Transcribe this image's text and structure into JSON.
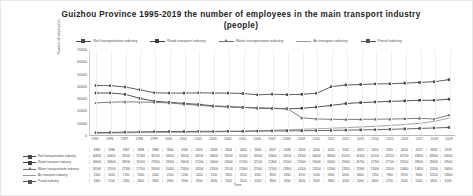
{
  "chart_data": {
    "type": "line",
    "title": "Guizhou Province 1995-2019 the number of employees in the main transport industry (people)",
    "xlabel": "Time",
    "ylabel": "Number of employees",
    "ylim": [
      0,
      70000
    ],
    "yticks": [
      0,
      10000,
      20000,
      30000,
      40000,
      50000,
      60000,
      70000
    ],
    "grid": true,
    "legend_position": "top",
    "x": [
      1995,
      1996,
      1997,
      1998,
      1999,
      2000,
      2001,
      2002,
      2003,
      2004,
      2005,
      2006,
      2007,
      2008,
      2009,
      2010,
      2011,
      2012,
      2013,
      2014,
      2015,
      2016,
      2017,
      2018,
      2019
    ],
    "categories": [
      "1995",
      "1996",
      "1997",
      "1998",
      "1999",
      "2000",
      "2001",
      "2002",
      "2003",
      "2004",
      "2005",
      "2006",
      "2007",
      "2008",
      "2009",
      "2010",
      "2011",
      "2012",
      "2013",
      "2014",
      "2015",
      "2016",
      "2017",
      "2018",
      "2019"
    ],
    "series": [
      {
        "name": "Rail transportation industry",
        "color": "#4a4a4a",
        "marker": "square",
        "values": [
          40800,
          40600,
          39500,
          37200,
          34700,
          34500,
          34500,
          34700,
          34600,
          34500,
          34200,
          33100,
          33600,
          33200,
          33500,
          34400,
          39800,
          41200,
          41600,
          42100,
          42200,
          42700,
          43300,
          43900,
          45600
        ]
      },
      {
        "name": "Road transport industry",
        "color": "#3f3f3f",
        "marker": "square",
        "values": [
          34600,
          34600,
          33500,
          30100,
          27800,
          26900,
          26000,
          25200,
          24000,
          23400,
          22700,
          22100,
          21800,
          21500,
          22000,
          23000,
          24400,
          25900,
          26700,
          27200,
          27700,
          28100,
          28600,
          28600,
          29500
        ]
      },
      {
        "name": "Water transportation industry",
        "color": "#6e6e6e",
        "marker": "triangle",
        "values": [
          26500,
          27000,
          27300,
          27100,
          26900,
          26400,
          25300,
          24500,
          23500,
          23100,
          22800,
          22300,
          22100,
          21800,
          14100,
          13200,
          12900,
          12800,
          12900,
          13000,
          13100,
          13400,
          13800,
          13100,
          16400
        ]
      },
      {
        "name": "Air transport industry",
        "color": "#9a9a9a",
        "marker": "none",
        "values": [
          1500,
          1600,
          1700,
          1900,
          2000,
          2100,
          2200,
          2400,
          2500,
          2800,
          3100,
          3500,
          3900,
          4300,
          4700,
          5100,
          5600,
          6000,
          6600,
          7200,
          7900,
          8700,
          9600,
          11200,
          13900
        ]
      },
      {
        "name": "Postal industry",
        "color": "#555555",
        "marker": "square",
        "values": [
          1900,
          2100,
          2400,
          2600,
          2800,
          2900,
          2900,
          3000,
          3000,
          3100,
          3100,
          3200,
          3300,
          3400,
          3500,
          3600,
          3800,
          4000,
          4200,
          4400,
          4700,
          5000,
          5400,
          5800,
          6200
        ]
      }
    ]
  },
  "legend": {
    "items": [
      {
        "label": "Rail transportation industry"
      },
      {
        "label": "Road transport industry"
      },
      {
        "label": "Water transportation industry"
      },
      {
        "label": "Air transport industry"
      },
      {
        "label": "Postal industry"
      }
    ]
  },
  "table": {
    "row_labels": [
      "Rail transportation industry",
      "Road transport industry",
      "Water transportation industry",
      "Air transport industry",
      "Postal industry"
    ]
  }
}
